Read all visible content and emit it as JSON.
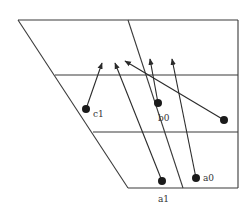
{
  "diagram": {
    "colors": {
      "line": "#3a3a3a",
      "dot": "#1a1a1a",
      "background": "#ffffff"
    },
    "points": [
      {
        "id": "c1",
        "label": "c1",
        "x": 86,
        "y": 109,
        "arrow_to": [
          102,
          63
        ]
      },
      {
        "id": "b0",
        "label": "b0",
        "x": 158,
        "y": 103,
        "arrow_to": [
          150,
          59
        ]
      },
      {
        "id": "p_right",
        "label": "",
        "x": 224,
        "y": 120,
        "arrow_to": [
          125,
          61
        ]
      },
      {
        "id": "a1",
        "label": "",
        "x": 162,
        "y": 181,
        "arrow_to": [
          115,
          63
        ]
      },
      {
        "id": "a0",
        "label": "a0",
        "x": 196,
        "y": 178,
        "arrow_to": [
          172,
          59
        ]
      }
    ],
    "bottom_label": "a1"
  }
}
